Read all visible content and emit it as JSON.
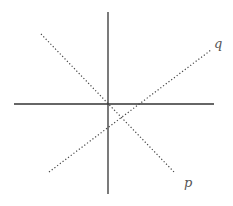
{
  "diagram": {
    "type": "coordinate-axes-with-two-lines",
    "axes": {
      "color": "#333333",
      "vertical": {
        "x": 108,
        "y1": 12,
        "y2": 194
      },
      "horizontal": {
        "y": 104,
        "x1": 14,
        "x2": 214
      }
    },
    "lines": [
      {
        "name": "p",
        "style": "dotted",
        "color": "#444444",
        "x1": 41,
        "y1": 34,
        "x2": 174,
        "y2": 172
      },
      {
        "name": "q",
        "style": "dotted",
        "color": "#444444",
        "x1": 49,
        "y1": 172,
        "x2": 211,
        "y2": 50
      }
    ],
    "labels": {
      "p": "p",
      "q": "q"
    }
  }
}
